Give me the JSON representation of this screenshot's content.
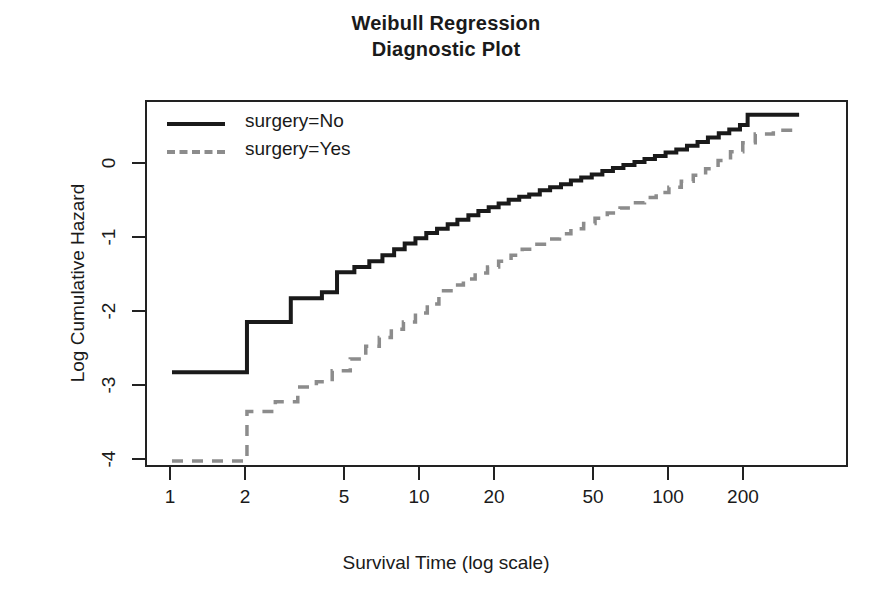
{
  "title": {
    "line1": "Weibull Regression",
    "line2": "Diagnostic Plot"
  },
  "axes": {
    "xlabel": "Survival Time (log scale)",
    "ylabel": "Log Cumulative Hazard",
    "x_ticks": [
      "1",
      "2",
      "5",
      "10",
      "20",
      "50",
      "100",
      "200"
    ],
    "y_ticks": [
      "0",
      "-1",
      "-2",
      "-3",
      "-4"
    ]
  },
  "legend": {
    "items": [
      {
        "label": "surgery=No",
        "style": "solid",
        "color": "#1a1a1a"
      },
      {
        "label": "surgery=Yes",
        "style": "dashed",
        "color": "#8c8c8c"
      }
    ]
  },
  "chart_data": {
    "type": "line",
    "title": "Weibull Regression Diagnostic Plot",
    "xlabel": "Survival Time (log scale)",
    "ylabel": "Log Cumulative Hazard",
    "xscale": "log",
    "xlim": [
      1,
      330
    ],
    "ylim": [
      -4.25,
      0.95
    ],
    "grid": false,
    "legend_position": "top-left",
    "x_tick_values": [
      1,
      2,
      5,
      10,
      20,
      50,
      100,
      200
    ],
    "y_tick_values": [
      0,
      -1,
      -2,
      -3,
      -4
    ],
    "series": [
      {
        "name": "surgery=No",
        "style": "solid",
        "color": "#1a1a1a",
        "step": true,
        "points": [
          [
            1.0,
            -2.8
          ],
          [
            2.0,
            -2.8
          ],
          [
            2.0,
            -2.12
          ],
          [
            3.0,
            -2.12
          ],
          [
            3.0,
            -1.8
          ],
          [
            4.0,
            -1.8
          ],
          [
            4.0,
            -1.72
          ],
          [
            4.6,
            -1.72
          ],
          [
            4.6,
            -1.45
          ],
          [
            5.4,
            -1.45
          ],
          [
            5.4,
            -1.38
          ],
          [
            6.2,
            -1.38
          ],
          [
            6.2,
            -1.3
          ],
          [
            7.0,
            -1.3
          ],
          [
            7.0,
            -1.22
          ],
          [
            7.8,
            -1.22
          ],
          [
            7.8,
            -1.14
          ],
          [
            8.6,
            -1.14
          ],
          [
            8.6,
            -1.06
          ],
          [
            9.5,
            -1.06
          ],
          [
            9.5,
            -0.99
          ],
          [
            10.5,
            -0.99
          ],
          [
            10.5,
            -0.92
          ],
          [
            11.6,
            -0.92
          ],
          [
            11.6,
            -0.86
          ],
          [
            12.8,
            -0.86
          ],
          [
            12.8,
            -0.8
          ],
          [
            14.0,
            -0.8
          ],
          [
            14.0,
            -0.74
          ],
          [
            15.5,
            -0.74
          ],
          [
            15.5,
            -0.68
          ],
          [
            17.0,
            -0.68
          ],
          [
            17.0,
            -0.62
          ],
          [
            18.7,
            -0.62
          ],
          [
            18.7,
            -0.57
          ],
          [
            20.5,
            -0.57
          ],
          [
            20.5,
            -0.52
          ],
          [
            22.5,
            -0.52
          ],
          [
            22.5,
            -0.47
          ],
          [
            24.8,
            -0.47
          ],
          [
            24.8,
            -0.43
          ],
          [
            27.2,
            -0.43
          ],
          [
            27.2,
            -0.4
          ],
          [
            30.0,
            -0.4
          ],
          [
            30.0,
            -0.34
          ],
          [
            33.0,
            -0.34
          ],
          [
            33.0,
            -0.3
          ],
          [
            36.5,
            -0.3
          ],
          [
            36.5,
            -0.26
          ],
          [
            40.0,
            -0.26
          ],
          [
            40.0,
            -0.21
          ],
          [
            44.0,
            -0.21
          ],
          [
            44.0,
            -0.17
          ],
          [
            48.5,
            -0.17
          ],
          [
            48.5,
            -0.13
          ],
          [
            53.5,
            -0.13
          ],
          [
            53.5,
            -0.08
          ],
          [
            59.0,
            -0.08
          ],
          [
            59.0,
            -0.04
          ],
          [
            65.0,
            -0.04
          ],
          [
            65.0,
            0.0
          ],
          [
            72.0,
            0.0
          ],
          [
            72.0,
            0.04
          ],
          [
            79.0,
            0.04
          ],
          [
            79.0,
            0.08
          ],
          [
            87.0,
            0.08
          ],
          [
            87.0,
            0.12
          ],
          [
            96.0,
            0.12
          ],
          [
            96.0,
            0.17
          ],
          [
            106.0,
            0.17
          ],
          [
            106.0,
            0.21
          ],
          [
            117.0,
            0.21
          ],
          [
            117.0,
            0.26
          ],
          [
            129.0,
            0.26
          ],
          [
            129.0,
            0.31
          ],
          [
            142.0,
            0.31
          ],
          [
            142.0,
            0.37
          ],
          [
            157.0,
            0.37
          ],
          [
            157.0,
            0.43
          ],
          [
            173.0,
            0.43
          ],
          [
            173.0,
            0.48
          ],
          [
            191.0,
            0.48
          ],
          [
            191.0,
            0.54
          ],
          [
            205.0,
            0.54
          ],
          [
            205.0,
            0.68
          ],
          [
            330.0,
            0.68
          ]
        ]
      },
      {
        "name": "surgery=Yes",
        "style": "dashed",
        "color": "#8c8c8c",
        "step": true,
        "points": [
          [
            1.0,
            -4.0
          ],
          [
            2.0,
            -4.0
          ],
          [
            2.0,
            -3.33
          ],
          [
            2.6,
            -3.33
          ],
          [
            2.6,
            -3.2
          ],
          [
            3.2,
            -3.2
          ],
          [
            3.2,
            -3.0
          ],
          [
            3.8,
            -3.0
          ],
          [
            3.8,
            -2.93
          ],
          [
            4.4,
            -2.93
          ],
          [
            4.4,
            -2.78
          ],
          [
            5.2,
            -2.78
          ],
          [
            5.2,
            -2.62
          ],
          [
            6.0,
            -2.62
          ],
          [
            6.0,
            -2.45
          ],
          [
            6.8,
            -2.45
          ],
          [
            6.8,
            -2.33
          ],
          [
            7.6,
            -2.33
          ],
          [
            7.6,
            -2.22
          ],
          [
            8.5,
            -2.22
          ],
          [
            8.5,
            -2.12
          ],
          [
            9.5,
            -2.12
          ],
          [
            9.5,
            -2.0
          ],
          [
            10.6,
            -2.0
          ],
          [
            10.6,
            -1.88
          ],
          [
            11.8,
            -1.88
          ],
          [
            11.8,
            -1.7
          ],
          [
            13.2,
            -1.7
          ],
          [
            13.2,
            -1.62
          ],
          [
            14.8,
            -1.62
          ],
          [
            14.8,
            -1.54
          ],
          [
            16.5,
            -1.54
          ],
          [
            16.5,
            -1.46
          ],
          [
            18.5,
            -1.46
          ],
          [
            18.5,
            -1.38
          ],
          [
            20.5,
            -1.38
          ],
          [
            20.5,
            -1.3
          ],
          [
            23.0,
            -1.3
          ],
          [
            23.0,
            -1.22
          ],
          [
            25.5,
            -1.22
          ],
          [
            25.5,
            -1.14
          ],
          [
            28.5,
            -1.14
          ],
          [
            28.5,
            -1.07
          ],
          [
            32.0,
            -1.07
          ],
          [
            32.0,
            -1.0
          ],
          [
            36.0,
            -1.0
          ],
          [
            36.0,
            -0.93
          ],
          [
            40.0,
            -0.93
          ],
          [
            40.0,
            -0.86
          ],
          [
            45.0,
            -0.86
          ],
          [
            45.0,
            -0.79
          ],
          [
            50.0,
            -0.79
          ],
          [
            50.0,
            -0.72
          ],
          [
            56.0,
            -0.72
          ],
          [
            56.0,
            -0.65
          ],
          [
            63.0,
            -0.65
          ],
          [
            63.0,
            -0.58
          ],
          [
            70.0,
            -0.58
          ],
          [
            70.0,
            -0.51
          ],
          [
            79.0,
            -0.51
          ],
          [
            79.0,
            -0.44
          ],
          [
            88.0,
            -0.44
          ],
          [
            88.0,
            -0.37
          ],
          [
            99.0,
            -0.37
          ],
          [
            99.0,
            -0.3
          ],
          [
            111.0,
            -0.3
          ],
          [
            111.0,
            -0.22
          ],
          [
            124.0,
            -0.22
          ],
          [
            124.0,
            -0.14
          ],
          [
            139.0,
            -0.14
          ],
          [
            139.0,
            -0.05
          ],
          [
            156.0,
            -0.05
          ],
          [
            156.0,
            0.06
          ],
          [
            175.0,
            0.06
          ],
          [
            175.0,
            0.18
          ],
          [
            196.0,
            0.18
          ],
          [
            196.0,
            0.3
          ],
          [
            220.0,
            0.3
          ],
          [
            220.0,
            0.42
          ],
          [
            260.0,
            0.42
          ],
          [
            260.0,
            0.47
          ],
          [
            330.0,
            0.47
          ]
        ]
      }
    ]
  }
}
